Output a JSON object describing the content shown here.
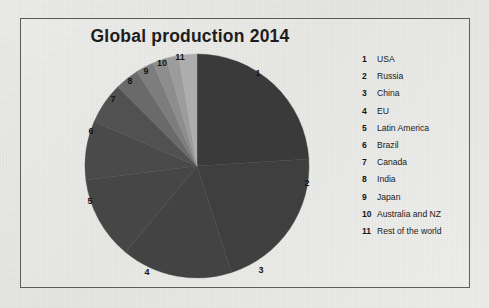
{
  "figure": {
    "title": "Global production 2014",
    "frame_color": "#5d5d5d",
    "background_color": "#e9e9e7"
  },
  "chart_data": {
    "type": "pie",
    "title": "Global production 2014",
    "xlabel": "",
    "ylabel": "",
    "legend_position": "right",
    "grid": false,
    "start_angle_deg": 0,
    "direction": "clockwise",
    "categories": [
      "USA",
      "Russia",
      "China",
      "EU",
      "Latin America",
      "Brazil",
      "Canada",
      "India",
      "Japan",
      "Australia and NZ",
      "Rest of the world"
    ],
    "values": [
      24.0,
      21.0,
      16.0,
      12.0,
      8.5,
      6.0,
      3.5,
      2.6,
      2.0,
      1.8,
      2.6
    ],
    "units": "percent",
    "slices": [
      {
        "index": "1",
        "label": "USA",
        "value": 24.0,
        "color": "#3a3a3a",
        "start_deg": 0.0,
        "end_deg": 86.4,
        "label_pos": {
          "x": 258,
          "y": 73
        }
      },
      {
        "index": "2",
        "label": "Russia",
        "value": 21.0,
        "color": "#3f3f3f",
        "start_deg": 86.4,
        "end_deg": 162.0,
        "label_pos": {
          "x": 307,
          "y": 183
        }
      },
      {
        "index": "3",
        "label": "China",
        "value": 16.0,
        "color": "#434343",
        "start_deg": 162.0,
        "end_deg": 219.6,
        "label_pos": {
          "x": 261,
          "y": 270
        }
      },
      {
        "index": "4",
        "label": "EU",
        "value": 12.0,
        "color": "#464646",
        "start_deg": 219.6,
        "end_deg": 262.8,
        "label_pos": {
          "x": 147,
          "y": 272
        }
      },
      {
        "index": "5",
        "label": "Latin America",
        "value": 8.5,
        "color": "#4a4a4a",
        "start_deg": 262.8,
        "end_deg": 293.4,
        "label_pos": {
          "x": 90,
          "y": 201
        }
      },
      {
        "index": "6",
        "label": "Brazil",
        "value": 6.0,
        "color": "#515151",
        "start_deg": 293.4,
        "end_deg": 315.0,
        "label_pos": {
          "x": 91,
          "y": 131
        }
      },
      {
        "index": "7",
        "label": "Canada",
        "value": 3.5,
        "color": "#6a6a6a",
        "start_deg": 315.0,
        "end_deg": 327.6,
        "label_pos": {
          "x": 113,
          "y": 99
        }
      },
      {
        "index": "8",
        "label": "India",
        "value": 2.6,
        "color": "#7d7d7d",
        "start_deg": 327.6,
        "end_deg": 336.9,
        "label_pos": {
          "x": 130,
          "y": 81
        }
      },
      {
        "index": "9",
        "label": "Japan",
        "value": 2.0,
        "color": "#8d8d8d",
        "start_deg": 336.9,
        "end_deg": 344.1,
        "label_pos": {
          "x": 146,
          "y": 71
        }
      },
      {
        "index": "10",
        "label": "Australia and NZ",
        "value": 1.8,
        "color": "#9c9c9c",
        "start_deg": 344.1,
        "end_deg": 350.6,
        "label_pos": {
          "x": 162,
          "y": 63
        }
      },
      {
        "index": "11",
        "label": "Rest of the world",
        "value": 2.6,
        "color": "#adadad",
        "start_deg": 350.6,
        "end_deg": 360.0,
        "label_pos": {
          "x": 180,
          "y": 57
        }
      }
    ],
    "geometry": {
      "cx": 197,
      "cy": 166,
      "r": 112
    }
  },
  "legend": {
    "items": [
      {
        "num": "1",
        "label": "USA"
      },
      {
        "num": "2",
        "label": "Russia"
      },
      {
        "num": "3",
        "label": "China"
      },
      {
        "num": "4",
        "label": "EU"
      },
      {
        "num": "5",
        "label": "Latin America"
      },
      {
        "num": "6",
        "label": "Brazil"
      },
      {
        "num": "7",
        "label": "Canada"
      },
      {
        "num": "8",
        "label": "India"
      },
      {
        "num": "9",
        "label": "Japan"
      },
      {
        "num": "10",
        "label": "Australia and NZ"
      },
      {
        "num": "11",
        "label": "Rest of the world"
      }
    ]
  }
}
